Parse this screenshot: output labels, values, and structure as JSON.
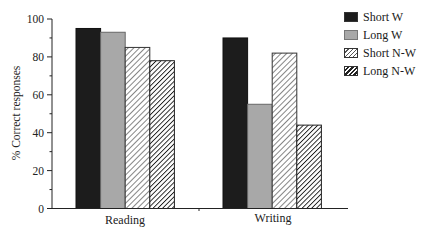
{
  "chart_data": {
    "type": "bar",
    "title": "",
    "xlabel": "",
    "ylabel": "% Correct responses",
    "ylim": [
      0,
      100
    ],
    "yticks": [
      0,
      20,
      40,
      60,
      80,
      100
    ],
    "grid": false,
    "legend_position": "top-right",
    "categories": [
      "Reading",
      "Writing"
    ],
    "series": [
      {
        "name": "Short W",
        "values": [
          95,
          90
        ],
        "fill": "#1c1c1c",
        "pattern": "solid-dark"
      },
      {
        "name": "Long W",
        "values": [
          93,
          55
        ],
        "fill": "#a8a8a8",
        "pattern": "solid-gray"
      },
      {
        "name": "Short N-W",
        "values": [
          85,
          82
        ],
        "fill": "#ffffff",
        "pattern": "light-diagonal-hatch"
      },
      {
        "name": "Long N-W",
        "values": [
          78,
          44
        ],
        "fill": "#ffffff",
        "pattern": "dense-diagonal-hatch"
      }
    ]
  },
  "legend": {
    "items": [
      {
        "label": "Short W"
      },
      {
        "label": "Long W"
      },
      {
        "label": "Short N-W"
      },
      {
        "label": "Long N-W"
      }
    ]
  },
  "axis": {
    "ylabel": "% Correct responses",
    "tick_labels": [
      "0",
      "20",
      "40",
      "60",
      "80",
      "100"
    ],
    "categories": [
      "Reading",
      "Writing"
    ]
  }
}
